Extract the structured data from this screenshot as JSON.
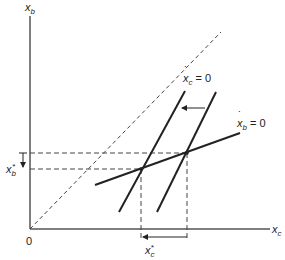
{
  "diagram": {
    "axes": {
      "y_label_var": "x",
      "y_label_sub": "b",
      "x_label_var": "x",
      "x_label_sub": "c",
      "origin_label": "0"
    },
    "curves": {
      "xc_dot_label": {
        "var": "x",
        "sub": "c",
        "eq": "= 0"
      },
      "xb_dot_label": {
        "var": "x",
        "sub": "b",
        "eq": "= 0"
      }
    },
    "equilibrium_labels": {
      "xb_star": {
        "var": "x",
        "sub": "b",
        "sup": "*"
      },
      "xc_star": {
        "var": "x",
        "sub": "c",
        "sup": "*"
      }
    },
    "colors": {
      "line": "#222222",
      "axis": "#555555",
      "dashed": "#444444"
    }
  }
}
